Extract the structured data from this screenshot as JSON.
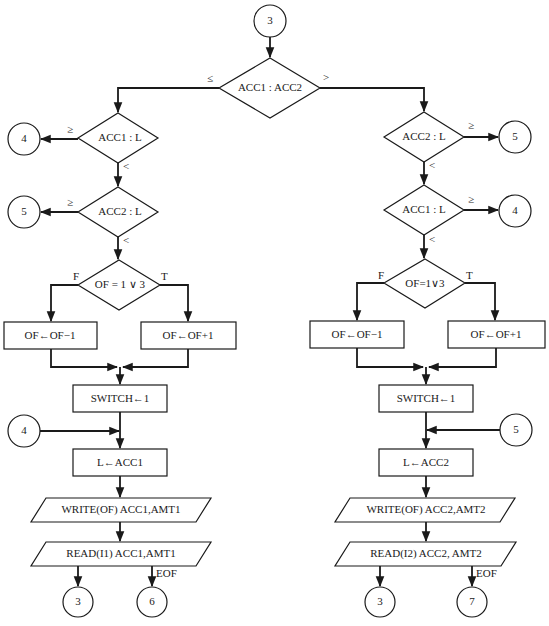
{
  "diagram": {
    "entry_connector": "3",
    "top_decision": {
      "text": "ACC1 : ACC2",
      "left_label": "≤",
      "right_label": ">"
    },
    "left": {
      "d1": {
        "text": "ACC1 : L",
        "ge_label": "≥",
        "lt_label": "<",
        "connector": "4"
      },
      "d2": {
        "text": "ACC2 : L",
        "ge_label": "≥",
        "lt_label": "<",
        "connector": "5"
      },
      "d3": {
        "text": "OF = 1 ∨ 3",
        "f_label": "F",
        "t_label": "T"
      },
      "box_f": "OF←OF−1",
      "box_t": "OF←OF+1",
      "switch": "SWITCH←1",
      "join_connector": "4",
      "assign": "L←ACC1",
      "write": "WRITE(OF) ACC1,AMT1",
      "read": "READ(I1) ACC1,AMT1",
      "exit_connector": "3",
      "eof_label": "EOF",
      "eof_connector": "6"
    },
    "right": {
      "d1": {
        "text": "ACC2 : L",
        "ge_label": "≥",
        "lt_label": "<",
        "connector": "5"
      },
      "d2": {
        "text": "ACC1 : L",
        "ge_label": "≥",
        "lt_label": "<",
        "connector": "4"
      },
      "d3": {
        "text": "OF=1∨3",
        "f_label": "F",
        "t_label": "T"
      },
      "box_f": "OF←OF−1",
      "box_t": "OF←OF+1",
      "switch": "SWITCH←1",
      "join_connector": "5",
      "assign": "L←ACC2",
      "write": "WRITE(OF) ACC2,AMT2",
      "read": "READ(I2) ACC2, AMT2",
      "exit_connector": "3",
      "eof_label": "EOF",
      "eof_connector": "7"
    }
  }
}
